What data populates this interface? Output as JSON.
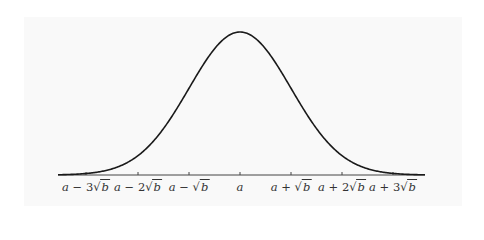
{
  "figure": {
    "title": "",
    "curve_color": "#1a1a1a",
    "axis_color": "#444444",
    "mean_symbol": "a",
    "variance_symbol": "b"
  },
  "axis": {
    "ticks": [
      {
        "label_prefix": "a − 3",
        "label_var": "b",
        "x": 86
      },
      {
        "label_prefix": "a − 2",
        "label_var": "b",
        "x": 138
      },
      {
        "label_prefix": "a − ",
        "label_var": "b",
        "x": 189
      },
      {
        "label_prefix": "a",
        "label_var": "",
        "x": 240
      },
      {
        "label_prefix": "a + ",
        "label_var": "b",
        "x": 291
      },
      {
        "label_prefix": "a + 2",
        "label_var": "b",
        "x": 342
      },
      {
        "label_prefix": "a + 3",
        "label_var": "b",
        "x": 393
      }
    ]
  }
}
